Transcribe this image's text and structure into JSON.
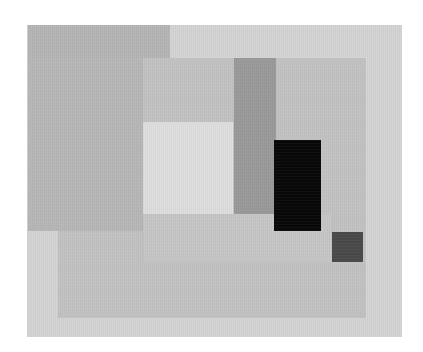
{
  "artwork": {
    "description": "Abstract geometric composition of overlapping gray rectangles with a black rectangle and a small dark-gray square",
    "canvas": {
      "width": 423,
      "height": 352,
      "background": "#ffffff"
    },
    "shapes": [
      {
        "name": "canvas-outer",
        "x": 27,
        "y": 25,
        "w": 375,
        "h": 312,
        "color": "#d4d4d4"
      },
      {
        "name": "top-left-dark-block",
        "x": 28,
        "y": 25,
        "w": 142,
        "h": 206,
        "color": "#b5b5b5"
      },
      {
        "name": "middle-panel",
        "x": 58,
        "y": 58,
        "w": 308,
        "h": 260,
        "color": "#c2c2c2"
      },
      {
        "name": "left-dark-continuation",
        "x": 28,
        "y": 58,
        "w": 115,
        "h": 173,
        "color": "#b7b7b7"
      },
      {
        "name": "light-square",
        "x": 143,
        "y": 122,
        "w": 90,
        "h": 92,
        "color": "#dedede"
      },
      {
        "name": "gray-vertical-bar",
        "x": 234,
        "y": 58,
        "w": 42,
        "h": 156,
        "color": "#9a9a9a"
      },
      {
        "name": "band-below-square",
        "x": 143,
        "y": 214,
        "w": 189,
        "h": 48,
        "color": "#c6c6c6"
      },
      {
        "name": "black-rectangle",
        "x": 274,
        "y": 140,
        "w": 47,
        "h": 91,
        "color": "#080808"
      },
      {
        "name": "dark-gray-square",
        "x": 332,
        "y": 232,
        "w": 31,
        "h": 30,
        "color": "#4a4a4a"
      }
    ]
  }
}
